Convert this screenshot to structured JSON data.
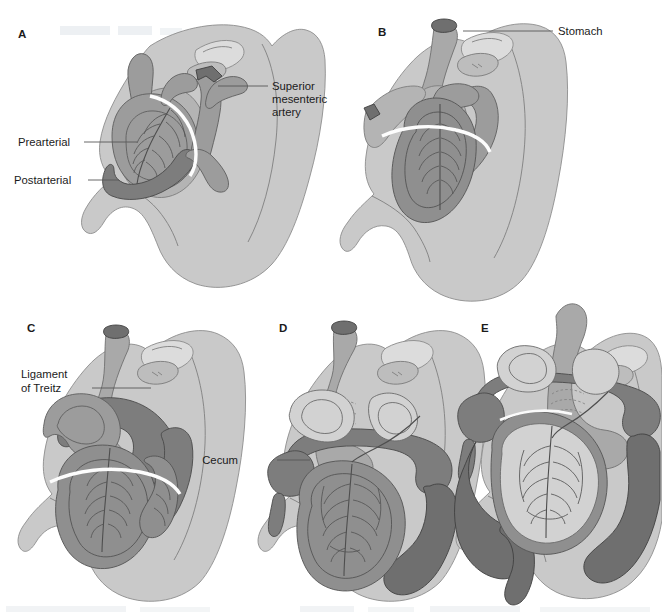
{
  "figure": {
    "background_color": "#ffffff",
    "width": 662,
    "height": 615,
    "watermark_text": "",
    "panel_count": 5
  },
  "palette": {
    "body_wall": "#c9c9c9",
    "mesentery": "#b4b4b4",
    "stomach": "#a9a9a9",
    "duodenum": "#9c9c9c",
    "colon": "#7d7d7d",
    "colon_dark": "#6f6f6f",
    "small_bowel": "#8f8f8f",
    "lumen": "#d2d2d2",
    "vessel_stroke": "#4e4e4e",
    "leader_line": "#585858",
    "text": "#1b1b1b",
    "white_band": "#fdfdfd"
  },
  "panels": [
    {
      "id": "A",
      "letter": "A",
      "letter_x": 18,
      "letter_y": 38,
      "annotations": [
        {
          "name": "superior-mesenteric-artery",
          "lines": [
            "Superior",
            "mesenteric",
            "artery"
          ],
          "text_x": 272,
          "text_y": 90,
          "anchor": "start",
          "leader": "M218,86 L268,86"
        },
        {
          "name": "prearterial",
          "lines": [
            "Prearterial"
          ],
          "text_x": 18,
          "text_y": 146,
          "anchor": "start",
          "leader": "M84,142 L137,142"
        },
        {
          "name": "postarterial",
          "lines": [
            "Postarterial"
          ],
          "text_x": 14,
          "text_y": 184,
          "anchor": "start",
          "leader": "M88,180 L119,180"
        }
      ]
    },
    {
      "id": "B",
      "letter": "B",
      "letter_x": 378,
      "letter_y": 36,
      "annotations": [
        {
          "name": "stomach",
          "lines": [
            "Stomach"
          ],
          "text_x": 558,
          "text_y": 35,
          "anchor": "start",
          "leader": "M463,31 L553,31"
        }
      ]
    },
    {
      "id": "C",
      "letter": "C",
      "letter_x": 27,
      "letter_y": 332,
      "annotations": [
        {
          "name": "ligament-of-treitz",
          "lines": [
            "Ligament",
            "of Treitz"
          ],
          "text_x": 21,
          "text_y": 378,
          "anchor": "start",
          "leader": "M92,388 L151,388"
        }
      ]
    },
    {
      "id": "D",
      "letter": "D",
      "letter_x": 279,
      "letter_y": 332,
      "annotations": [
        {
          "name": "cecum",
          "lines": [
            "Cecum"
          ],
          "text_x": 238,
          "text_y": 464,
          "anchor": "start",
          "leader": "M277,460 L310,460"
        }
      ]
    },
    {
      "id": "E",
      "letter": "E",
      "letter_x": 481,
      "letter_y": 332,
      "annotations": []
    }
  ],
  "legend_note": ""
}
